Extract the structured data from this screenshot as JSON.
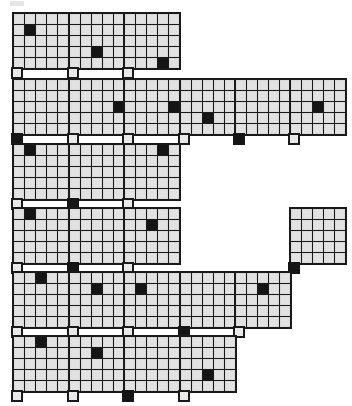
{
  "page": {
    "width_px": 352,
    "height_px": 406,
    "background_color": "#ffffff",
    "ink_color": "#151515",
    "cell_color": "#e2e2e2",
    "grid_line_color": "#1a1a1a"
  },
  "legend": {
    "filled_cell_label": "filled",
    "empty_cell_label": "empty",
    "tail_label": "tail"
  },
  "glyph_spec": {
    "matrix_rows": 5,
    "matrix_cols": 5,
    "cell_size_px": 10,
    "tail_size_px": 10,
    "tail_position": "below-left",
    "filled_count_per_glyph": 1
  },
  "grid_layout": {
    "rows": 6,
    "cols": 6,
    "row_tops_px": [
      12,
      78,
      143,
      207,
      271,
      335
    ],
    "col_lefts_px": [
      12,
      68,
      123,
      179,
      234,
      289
    ],
    "glyph_width_px": 53,
    "glyph_height_px": 62
  },
  "glyphs": [
    {
      "id": "r1c1",
      "row": 1,
      "col": 1,
      "present": true,
      "fill": {
        "type": "cell",
        "row": 2,
        "col": 2
      },
      "tail_filled": false
    },
    {
      "id": "r1c2",
      "row": 1,
      "col": 2,
      "present": true,
      "fill": {
        "type": "cell",
        "row": 4,
        "col": 3
      },
      "tail_filled": false
    },
    {
      "id": "r1c3",
      "row": 1,
      "col": 3,
      "present": true,
      "fill": {
        "type": "cell",
        "row": 5,
        "col": 4
      },
      "tail_filled": false
    },
    {
      "id": "r1c4",
      "row": 1,
      "col": 4,
      "present": false,
      "fill": null,
      "tail_filled": false
    },
    {
      "id": "r1c5",
      "row": 1,
      "col": 5,
      "present": false,
      "fill": null,
      "tail_filled": false
    },
    {
      "id": "r1c6",
      "row": 1,
      "col": 6,
      "present": false,
      "fill": null,
      "tail_filled": false
    },
    {
      "id": "r2c1",
      "row": 2,
      "col": 1,
      "present": true,
      "fill": {
        "type": "tail"
      },
      "tail_filled": true
    },
    {
      "id": "r2c2",
      "row": 2,
      "col": 2,
      "present": true,
      "fill": {
        "type": "cell",
        "row": 3,
        "col": 5
      },
      "tail_filled": false
    },
    {
      "id": "r2c3",
      "row": 2,
      "col": 3,
      "present": true,
      "fill": {
        "type": "cell",
        "row": 3,
        "col": 5
      },
      "tail_filled": false
    },
    {
      "id": "r2c4",
      "row": 2,
      "col": 4,
      "present": true,
      "fill": {
        "type": "cell",
        "row": 4,
        "col": 3
      },
      "tail_filled": false
    },
    {
      "id": "r2c5",
      "row": 2,
      "col": 5,
      "present": true,
      "fill": {
        "type": "tail"
      },
      "tail_filled": true
    },
    {
      "id": "r2c6",
      "row": 2,
      "col": 6,
      "present": true,
      "fill": {
        "type": "cell",
        "row": 3,
        "col": 3
      },
      "tail_filled": false
    },
    {
      "id": "r3c1",
      "row": 3,
      "col": 1,
      "present": true,
      "fill": {
        "type": "cell",
        "row": 1,
        "col": 2
      },
      "tail_filled": false
    },
    {
      "id": "r3c2",
      "row": 3,
      "col": 2,
      "present": true,
      "fill": {
        "type": "tail"
      },
      "tail_filled": true
    },
    {
      "id": "r3c3",
      "row": 3,
      "col": 3,
      "present": true,
      "fill": {
        "type": "cell",
        "row": 1,
        "col": 4
      },
      "tail_filled": false
    },
    {
      "id": "r3c4",
      "row": 3,
      "col": 4,
      "present": false,
      "fill": null,
      "tail_filled": false
    },
    {
      "id": "r3c5",
      "row": 3,
      "col": 5,
      "present": false,
      "fill": null,
      "tail_filled": false
    },
    {
      "id": "r3c6",
      "row": 3,
      "col": 6,
      "present": false,
      "fill": null,
      "tail_filled": false
    },
    {
      "id": "r4c1",
      "row": 4,
      "col": 1,
      "present": true,
      "fill": {
        "type": "cell",
        "row": 1,
        "col": 2
      },
      "tail_filled": false
    },
    {
      "id": "r4c2",
      "row": 4,
      "col": 2,
      "present": true,
      "fill": {
        "type": "tail"
      },
      "tail_filled": true
    },
    {
      "id": "r4c3",
      "row": 4,
      "col": 3,
      "present": true,
      "fill": {
        "type": "cell",
        "row": 2,
        "col": 3
      },
      "tail_filled": false
    },
    {
      "id": "r4c4",
      "row": 4,
      "col": 4,
      "present": false,
      "fill": null,
      "tail_filled": false
    },
    {
      "id": "r4c5",
      "row": 4,
      "col": 5,
      "present": false,
      "fill": null,
      "tail_filled": false
    },
    {
      "id": "r4c6",
      "row": 4,
      "col": 6,
      "present": true,
      "fill": {
        "type": "tail"
      },
      "tail_filled": true
    },
    {
      "id": "r5c1",
      "row": 5,
      "col": 1,
      "present": true,
      "fill": {
        "type": "cell",
        "row": 1,
        "col": 3
      },
      "tail_filled": false
    },
    {
      "id": "r5c2",
      "row": 5,
      "col": 2,
      "present": true,
      "fill": {
        "type": "cell",
        "row": 2,
        "col": 3
      },
      "tail_filled": false
    },
    {
      "id": "r5c3",
      "row": 5,
      "col": 3,
      "present": true,
      "fill": {
        "type": "cell",
        "row": 2,
        "col": 2
      },
      "tail_filled": false
    },
    {
      "id": "r5c4",
      "row": 5,
      "col": 4,
      "present": true,
      "fill": {
        "type": "tail"
      },
      "tail_filled": true
    },
    {
      "id": "r5c5",
      "row": 5,
      "col": 5,
      "present": true,
      "fill": {
        "type": "cell",
        "row": 2,
        "col": 3
      },
      "tail_filled": false
    },
    {
      "id": "r5c6",
      "row": 5,
      "col": 6,
      "present": false,
      "fill": null,
      "tail_filled": false
    },
    {
      "id": "r6c1",
      "row": 6,
      "col": 1,
      "present": true,
      "fill": {
        "type": "cell",
        "row": 1,
        "col": 3
      },
      "tail_filled": false
    },
    {
      "id": "r6c2",
      "row": 6,
      "col": 2,
      "present": true,
      "fill": {
        "type": "cell",
        "row": 2,
        "col": 3
      },
      "tail_filled": false
    },
    {
      "id": "r6c3",
      "row": 6,
      "col": 3,
      "present": true,
      "fill": {
        "type": "tail"
      },
      "tail_filled": true
    },
    {
      "id": "r6c4",
      "row": 6,
      "col": 4,
      "present": true,
      "fill": {
        "type": "cell",
        "row": 4,
        "col": 3
      },
      "tail_filled": false
    },
    {
      "id": "r6c5",
      "row": 6,
      "col": 5,
      "present": false,
      "fill": null,
      "tail_filled": false
    },
    {
      "id": "r6c6",
      "row": 6,
      "col": 6,
      "present": false,
      "fill": null,
      "tail_filled": false
    }
  ]
}
